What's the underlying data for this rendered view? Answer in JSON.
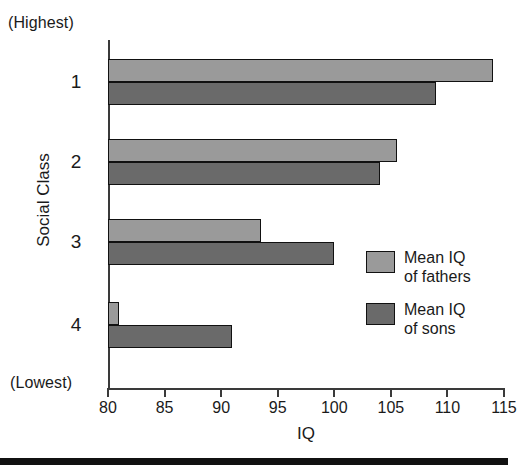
{
  "chart_data": {
    "type": "bar",
    "orientation": "horizontal",
    "title": "",
    "xlabel": "IQ",
    "ylabel": "Social Class",
    "categories": [
      "1",
      "2",
      "3",
      "4"
    ],
    "category_top_note": "(Highest)",
    "category_bottom_note": "(Lowest)",
    "xlim": [
      80,
      115
    ],
    "xticks": [
      80,
      85,
      90,
      95,
      100,
      105,
      110,
      115
    ],
    "xtick_labels": [
      "80",
      "85",
      "90",
      "95",
      "100",
      "105",
      "110",
      "115"
    ],
    "grid": false,
    "legend_position": "inside-right",
    "series": [
      {
        "name": "Mean IQ of fathers",
        "label_line1": "Mean IQ",
        "label_line2": "of fathers",
        "color": "#9a9a9a",
        "values": [
          114,
          105.5,
          93.5,
          81
        ]
      },
      {
        "name": "Mean IQ of sons",
        "label_line1": "Mean IQ",
        "label_line2": "of sons",
        "color": "#6a6a6a",
        "values": [
          109,
          104,
          100,
          91
        ]
      }
    ]
  },
  "axis": {
    "y_title": "Social Class",
    "x_title": "IQ",
    "highest_note": "(Highest)",
    "lowest_note": "(Lowest)"
  },
  "legend": {
    "items": [
      {
        "line1": "Mean IQ",
        "line2": "of fathers",
        "color": "#9a9a9a"
      },
      {
        "line1": "Mean IQ",
        "line2": "of sons",
        "color": "#6a6a6a"
      }
    ]
  },
  "colors": {
    "fathers": "#9a9a9a",
    "sons": "#6a6a6a",
    "axis": "#3a3a3a",
    "outline": "#111111",
    "text": "#1a1a1a",
    "background": "#ffffff"
  }
}
